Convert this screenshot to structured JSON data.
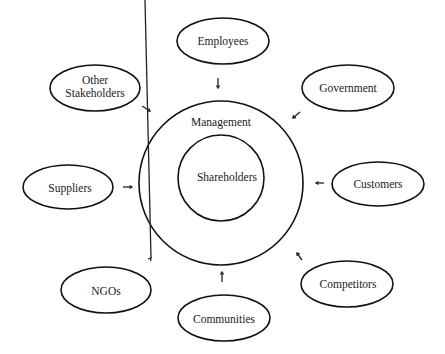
{
  "diagram": {
    "center": {
      "outer_label": "Management",
      "inner_label": "Shareholders"
    },
    "stakeholders": [
      {
        "id": "employees",
        "label": "Employees"
      },
      {
        "id": "other-stakeholders",
        "label_line1": "Other",
        "label_line2": "Stakeholders"
      },
      {
        "id": "government",
        "label": "Government"
      },
      {
        "id": "suppliers",
        "label": "Suppliers"
      },
      {
        "id": "customers",
        "label": "Customers"
      },
      {
        "id": "ngos",
        "label": "NGOs"
      },
      {
        "id": "communities",
        "label": "Communities"
      },
      {
        "id": "competitors",
        "label": "Competitors"
      }
    ],
    "colors": {
      "stroke": "#111111",
      "background": "#ffffff",
      "text": "#1a1a1a"
    }
  }
}
